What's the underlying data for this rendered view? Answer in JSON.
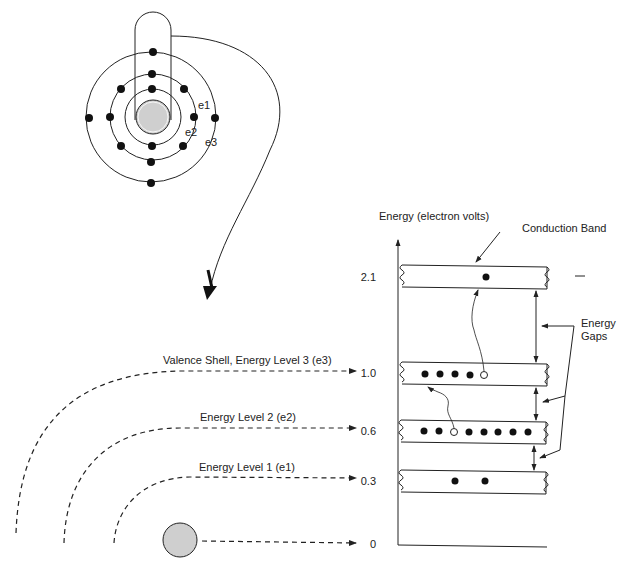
{
  "atom": {
    "shell_labels": [
      "e1",
      "e2",
      "e3"
    ],
    "electrons_per_shell": [
      2,
      8,
      4
    ]
  },
  "energy_axis": {
    "title": "Energy (electron volts)",
    "ticks": [
      "2.1",
      "1.0",
      "0.6",
      "0.3",
      "0"
    ]
  },
  "bands": [
    {
      "name": "Conduction Band",
      "energy": "2.1",
      "filled": 1,
      "holes": 0
    },
    {
      "name": "Valence Shell band",
      "energy": "1.0",
      "filled": 4,
      "holes": 1
    },
    {
      "name": "Energy Level 2 band",
      "energy": "0.6",
      "filled": 7,
      "holes": 1
    },
    {
      "name": "Energy Level 1 band",
      "energy": "0.3",
      "filled": 2,
      "holes": 0
    }
  ],
  "labels": {
    "conduction_band": "Conduction Band",
    "energy_gaps_line1": "Energy",
    "energy_gaps_line2": "Gaps",
    "level3": "Valence Shell, Energy Level 3 (e3)",
    "level2": "Energy Level 2 (e2)",
    "level1": "Energy Level 1 (e1)"
  },
  "colors": {
    "line": "#222222",
    "nucleus": "#cfcfcf",
    "electron": "#111111"
  }
}
